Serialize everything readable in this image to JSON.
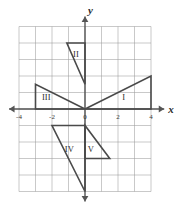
{
  "figure": {
    "type": "coordinate-plane-with-triangles",
    "background_color": "#ffffff",
    "grid_color": "#9a9a9a",
    "axis_color": "#555555",
    "shape_color": "#4a4a4a",
    "origin_px": {
      "x": 85,
      "y": 109
    },
    "unit_px": 16.5
  },
  "axes": {
    "x_axis": {
      "label": "x",
      "range": [
        -4.6,
        4.8
      ],
      "arrow_start": true,
      "arrow_end": true,
      "tick_labels": [
        {
          "text": "-4",
          "value": -4
        },
        {
          "text": "-2",
          "value": -2
        },
        {
          "text": "0",
          "value": 0
        },
        {
          "text": "2",
          "value": 2
        },
        {
          "text": "4",
          "value": 4
        }
      ]
    },
    "y_axis": {
      "label": "y",
      "range": [
        -5.6,
        5.6
      ],
      "arrow_start": true,
      "arrow_end": true,
      "tick_labels": []
    }
  },
  "chart_data": {
    "type": "scatter",
    "title": "",
    "xlabel": "x",
    "ylabel": "y",
    "xlim": [
      -4.6,
      4.8
    ],
    "ylim": [
      -5.6,
      5.6
    ],
    "grid": true,
    "series": [
      {
        "name": "I",
        "label": "I",
        "label_position": {
          "x": 2.35,
          "y": 0.55
        },
        "vertices": [
          {
            "x": 0,
            "y": 0
          },
          {
            "x": 4,
            "y": 0
          },
          {
            "x": 4,
            "y": 2
          }
        ]
      },
      {
        "name": "II",
        "label": "II",
        "label_position": {
          "x": -0.55,
          "y": 3.15
        },
        "vertices": [
          {
            "x": -1.1,
            "y": 4
          },
          {
            "x": 0,
            "y": 4
          },
          {
            "x": 0,
            "y": 1.5
          }
        ]
      },
      {
        "name": "III",
        "label": "III",
        "label_position": {
          "x": -2.35,
          "y": 0.55
        },
        "vertices": [
          {
            "x": -3,
            "y": 0
          },
          {
            "x": -3,
            "y": 1.5
          },
          {
            "x": 0,
            "y": 0
          }
        ]
      },
      {
        "name": "IV",
        "label": "IV",
        "label_position": {
          "x": -0.95,
          "y": -2.6
        },
        "vertices": [
          {
            "x": -2,
            "y": -1
          },
          {
            "x": 0,
            "y": -1
          },
          {
            "x": 0,
            "y": -5
          }
        ]
      },
      {
        "name": "V",
        "label": "V",
        "label_position": {
          "x": 0.35,
          "y": -2.6
        },
        "vertices": [
          {
            "x": 0,
            "y": -1
          },
          {
            "x": 0,
            "y": -3
          },
          {
            "x": 1.5,
            "y": -3
          }
        ]
      }
    ]
  }
}
